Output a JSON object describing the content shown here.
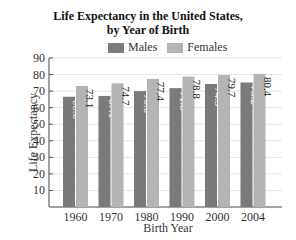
{
  "chart_data": {
    "type": "bar",
    "title": "Life Expectancy in the United States, by Year of Birth",
    "title_lines": [
      "Life Expectancy in the United States,",
      "by Year of Birth"
    ],
    "xlabel": "Birth Year",
    "ylabel": "Life Expectancy",
    "categories": [
      "1960",
      "1970",
      "1980",
      "1990",
      "2000",
      "2004"
    ],
    "series": [
      {
        "name": "Males",
        "color": "#7a7a7a",
        "values": [
          66.6,
          67.1,
          70.0,
          71.8,
          74.3,
          75.2
        ]
      },
      {
        "name": "Females",
        "color": "#b4b4b4",
        "values": [
          73.1,
          74.7,
          77.4,
          78.8,
          79.7,
          80.4
        ]
      }
    ],
    "yticks": [
      10,
      20,
      30,
      40,
      50,
      60,
      70,
      80,
      90
    ],
    "ylim": [
      0,
      90
    ],
    "grid": true,
    "legend_position": "top",
    "value_labels": [
      "66.6",
      "73.1",
      "67.1",
      "74.7",
      "70.0",
      "77.4",
      "71.8",
      "78.8",
      "74.3",
      "79.7",
      "75.2",
      "80.4"
    ]
  }
}
